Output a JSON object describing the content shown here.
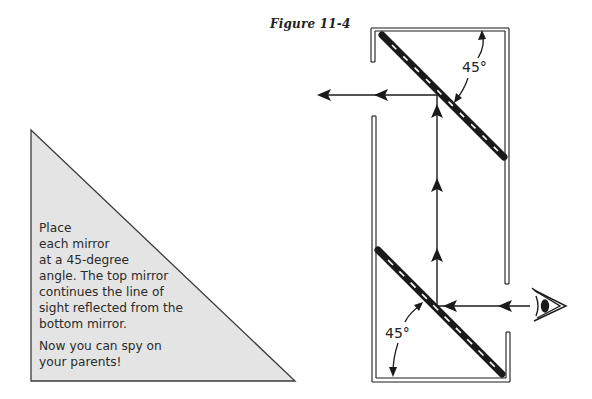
{
  "figure": {
    "title": "Figure 11-4"
  },
  "caption": {
    "lines": [
      "Place",
      "each mirror",
      "at a 45-degree",
      "angle. The top mirror",
      "continues the line of",
      "sight reflected from the",
      "bottom mirror."
    ],
    "closing_lines": [
      "Now you can spy on",
      "your parents!"
    ],
    "panel_color": "#e4e4e4"
  },
  "diagram": {
    "type": "periscope",
    "top_mirror_angle_label": "45°",
    "bottom_mirror_angle_label": "45°",
    "line_color": "#1a1a1a",
    "icons": [
      "eye-icon",
      "arrow-left-icon",
      "arrow-up-icon"
    ]
  }
}
